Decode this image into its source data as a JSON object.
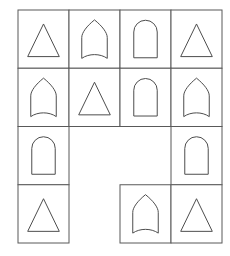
{
  "figure": {
    "type": "shape-grid-matrix",
    "background_color": "#ffffff",
    "line_color": "#595959",
    "shape_stroke_color": "#4d4d4d",
    "shape_fill_color": "#ffffff",
    "line_width": 1,
    "rows": 4,
    "columns": 4
  },
  "grid": {
    "left": 18,
    "top": 10,
    "cell_width": 51,
    "cell_height": 58.25,
    "column_edges": [
      18,
      69,
      120,
      171,
      222
    ],
    "row_edges": [
      10,
      68.25,
      126.5,
      184.75,
      243
    ]
  },
  "legend": {
    "shape_names": {
      "triangle": "triangle",
      "gothic_arch": "gothic-arch",
      "round_arch": "round-arch",
      "empty": "empty-cell"
    }
  },
  "chart_data": {
    "type": "table",
    "categories": [
      "col-1",
      "col-2",
      "col-3",
      "col-4"
    ],
    "row_labels": [
      "row-1",
      "row-2",
      "row-3",
      "row-4"
    ],
    "cells": [
      [
        {
          "row": 1,
          "col": 1,
          "shape": "triangle",
          "present": true
        },
        {
          "row": 1,
          "col": 2,
          "shape": "gothic_arch",
          "present": true
        },
        {
          "row": 1,
          "col": 3,
          "shape": "round_arch",
          "present": true
        },
        {
          "row": 1,
          "col": 4,
          "shape": "triangle",
          "present": true
        }
      ],
      [
        {
          "row": 2,
          "col": 1,
          "shape": "gothic_arch",
          "present": true
        },
        {
          "row": 2,
          "col": 2,
          "shape": "triangle",
          "present": true
        },
        {
          "row": 2,
          "col": 3,
          "shape": "round_arch",
          "present": true
        },
        {
          "row": 2,
          "col": 4,
          "shape": "gothic_arch",
          "present": true
        }
      ],
      [
        {
          "row": 3,
          "col": 1,
          "shape": "round_arch",
          "present": true
        },
        {
          "row": 3,
          "col": 2,
          "shape": "empty",
          "present": false
        },
        {
          "row": 3,
          "col": 3,
          "shape": "empty",
          "present": false
        },
        {
          "row": 3,
          "col": 4,
          "shape": "round_arch",
          "present": true
        }
      ],
      [
        {
          "row": 4,
          "col": 1,
          "shape": "triangle",
          "present": true
        },
        {
          "row": 4,
          "col": 2,
          "shape": "empty",
          "present": false
        },
        {
          "row": 4,
          "col": 3,
          "shape": "gothic_arch",
          "present": true
        },
        {
          "row": 4,
          "col": 4,
          "shape": "triangle",
          "present": true
        }
      ]
    ],
    "counts": {
      "triangle": 5,
      "gothic_arch": 4,
      "round_arch": 4,
      "empty": 3
    }
  }
}
